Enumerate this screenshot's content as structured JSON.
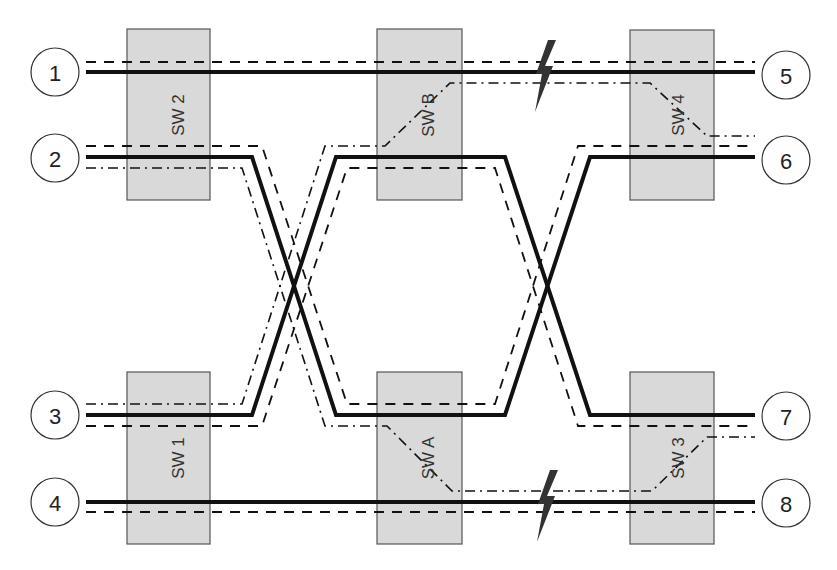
{
  "diagram": {
    "type": "network-switch-topology",
    "nodes": [
      {
        "id": "1",
        "label": "1"
      },
      {
        "id": "2",
        "label": "2"
      },
      {
        "id": "3",
        "label": "3"
      },
      {
        "id": "4",
        "label": "4"
      },
      {
        "id": "5",
        "label": "5"
      },
      {
        "id": "6",
        "label": "6"
      },
      {
        "id": "7",
        "label": "7"
      },
      {
        "id": "8",
        "label": "8"
      }
    ],
    "switches": [
      {
        "id": "sw2",
        "label": "SW 2"
      },
      {
        "id": "swb",
        "label": "SW B"
      },
      {
        "id": "sw4",
        "label": "SW 4"
      },
      {
        "id": "sw1",
        "label": "SW 1"
      },
      {
        "id": "swa",
        "label": "SW A"
      },
      {
        "id": "sw3",
        "label": "SW 3"
      }
    ],
    "line_styles": {
      "solid": "primary path",
      "dashed": "secondary path",
      "dash-dot": "rerouted path"
    },
    "faults": [
      {
        "id": "fault-top",
        "icon": "lightning-bolt-icon",
        "location": "link SW B – SW 4"
      },
      {
        "id": "fault-bottom",
        "icon": "lightning-bolt-icon",
        "location": "link SW A – SW 3"
      }
    ],
    "colors": {
      "switch_fill": "#d9d9d9",
      "switch_stroke": "#555555",
      "line": "#111111",
      "bolt": "#333333"
    }
  }
}
